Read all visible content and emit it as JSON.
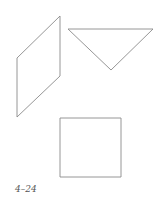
{
  "figure": {
    "caption": "4–24",
    "shapes": [
      {
        "type": "parallelogram",
        "points": "60,16 60,76 17,117 17,58"
      },
      {
        "type": "triangle",
        "points": "68,29 153,29 111,70"
      },
      {
        "type": "square",
        "points": "60,118 121,118 121,177 60,177"
      }
    ],
    "stroke_color": "#8a8a8a"
  }
}
